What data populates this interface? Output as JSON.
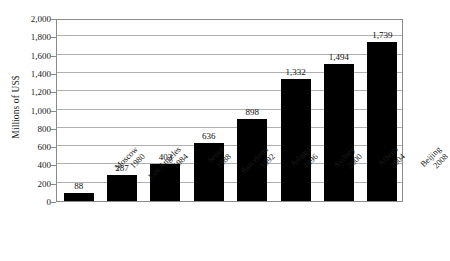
{
  "chart_data": {
    "type": "bar",
    "title": "",
    "subtitle": "",
    "xlabel": "",
    "ylabel": "Millions of US$",
    "ylim": [
      0,
      2000
    ],
    "ytick_step": 200,
    "grid": true,
    "legend": false,
    "bar_color": "#000000",
    "gridline_color": "#b0b0b0",
    "axis_color": "#8a8a8a",
    "background": "#ffffff",
    "categories": [
      "Moscow 1980",
      "Los Angeles 1984",
      "Seoul 1988",
      "Barcelona 1992",
      "Atlanta 1996",
      "Sydney 2000",
      "Athens 2004",
      "Beijing 2008"
    ],
    "cities": [
      "Moscow",
      "Los Angeles",
      "Seoul",
      "Barcelona",
      "Atlanta",
      "Sydney",
      "Athens",
      "Beijing"
    ],
    "years": [
      "1980",
      "1984",
      "1988",
      "1992",
      "1996",
      "2000",
      "2004",
      "2008"
    ],
    "values": [
      88,
      287,
      403,
      636,
      898,
      1332,
      1494,
      1739
    ],
    "value_labels": [
      "88",
      "287",
      "403",
      "636",
      "898",
      "1,332",
      "1,494",
      "1,739"
    ],
    "ytick_labels": [
      "0",
      "200",
      "400",
      "600",
      "800",
      "1,000",
      "1,200",
      "1,400",
      "1,600",
      "1,800",
      "2,000"
    ],
    "ytick_values": [
      0,
      200,
      400,
      600,
      800,
      1000,
      1200,
      1400,
      1600,
      1800,
      2000
    ]
  }
}
